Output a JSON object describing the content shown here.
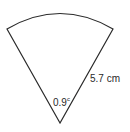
{
  "diagram": {
    "type": "sector",
    "angle": {
      "value": "0.9",
      "unit_superscript": "c"
    },
    "radius": {
      "label": "5.7 cm"
    },
    "colors": {
      "stroke": "#2a2a2a",
      "background": "#ffffff"
    }
  }
}
